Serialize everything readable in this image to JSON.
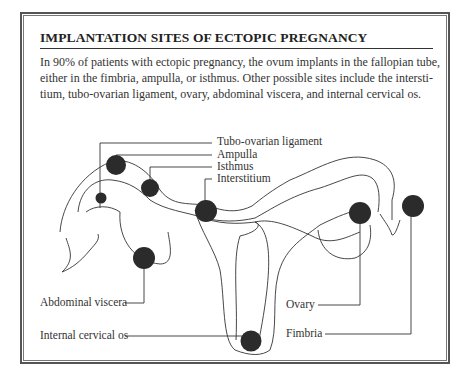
{
  "title": "IMPLANTATION SITES OF ECTOPIC PREGNANCY",
  "body_lines": [
    "In 90% of patients with ectopic pregnancy, the ovum implants in the fallopian tube,",
    "either in the fimbria, ampulla, or isthmus. Other possible sites include the intersti-",
    "tium, tubo-ovarian ligament, ovary, abdominal viscera, and internal cervical os."
  ],
  "labels": {
    "tubo_ovarian": "Tubo-ovarian ligament",
    "ampulla": "Ampulla",
    "isthmus": "Isthmus",
    "interstitium": "Interstitium",
    "abdominal": "Abdominal viscera",
    "internal_os": "Internal cervical os",
    "ovary": "Ovary",
    "fimbria": "Fimbria"
  },
  "colors": {
    "dot": "#2b2b2b",
    "line": "#333333",
    "border": "#555555"
  }
}
